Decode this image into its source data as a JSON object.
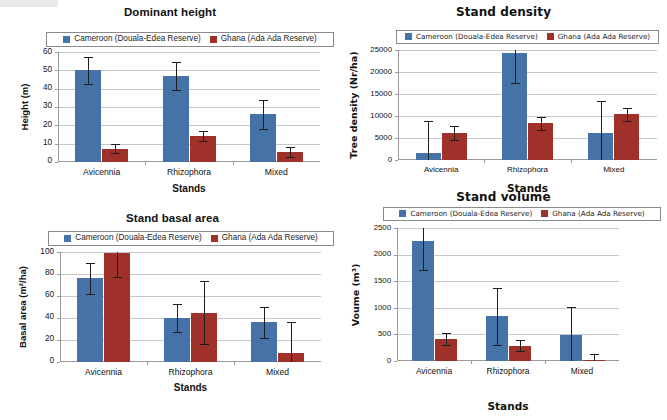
{
  "figure": {
    "legend": {
      "series": [
        {
          "name": "Cameroon (Douala-Edea Reserve)",
          "color": "#4573a7",
          "key": "cameroon"
        },
        {
          "name": "Ghana (Ada Ada Reserve)",
          "color": "#a0302a",
          "key": "ghana"
        }
      ]
    },
    "shared_categories": [
      "Avicennia",
      "Rhizophora",
      "Mixed"
    ],
    "shared_xlabel": "Stands"
  },
  "chart_data": [
    {
      "id": "dominant-height",
      "type": "bar",
      "title": "Dominant height",
      "xlabel": "Stands",
      "ylabel": "Height (m)",
      "categories": [
        "Avicennia",
        "Rhizophora",
        "Mixed"
      ],
      "yticks": [
        0,
        10,
        20,
        30,
        40,
        50,
        60
      ],
      "ylim": [
        0,
        60
      ],
      "grid": true,
      "legend_position": "top",
      "series": [
        {
          "name": "Cameroon (Douala-Edea Reserve)",
          "color": "#4573a7",
          "values": [
            50.0,
            47.0,
            26.0
          ],
          "errors": [
            7.5,
            7.5,
            8.0
          ]
        },
        {
          "name": "Ghana (Ada Ada Reserve)",
          "color": "#a0302a",
          "values": [
            7.3,
            14.3,
            5.5
          ],
          "errors": [
            2.5,
            2.7,
            2.6
          ]
        }
      ]
    },
    {
      "id": "stand-density",
      "type": "bar",
      "title": "Stand density",
      "xlabel": "Stands",
      "ylabel": "Tree density (Nr/ha)",
      "categories": [
        "Avicennia",
        "Rhizophora",
        "Mixed"
      ],
      "yticks": [
        0,
        5000,
        10000,
        15000,
        20000,
        25000
      ],
      "ylim": [
        0,
        25000
      ],
      "grid": true,
      "legend_position": "top",
      "series": [
        {
          "name": "Cameroon (Douala-Edea Reserve)",
          "color": "#4573a7",
          "values": [
            1700,
            24400,
            6200
          ],
          "errors": [
            7100,
            6800,
            7100
          ]
        },
        {
          "name": "Ghana (Ada Ada Reserve)",
          "color": "#a0302a",
          "values": [
            6100,
            8300,
            10400
          ],
          "errors": [
            1600,
            1500,
            1500
          ]
        }
      ]
    },
    {
      "id": "stand-basal-area",
      "type": "bar",
      "title": "Stand basal area",
      "xlabel": "Stands",
      "ylabel": "Basal area (m²/ha)",
      "categories": [
        "Avicennia",
        "Rhizophora",
        "Mixed"
      ],
      "yticks": [
        0,
        20,
        40,
        60,
        80,
        100
      ],
      "ylim": [
        0,
        100
      ],
      "grid": true,
      "legend_position": "top",
      "series": [
        {
          "name": "Cameroon (Douala-Edea Reserve)",
          "color": "#4573a7",
          "values": [
            76,
            40,
            36
          ],
          "errors": [
            14,
            13,
            14
          ]
        },
        {
          "name": "Ghana (Ada Ada Reserve)",
          "color": "#a0302a",
          "values": [
            99,
            45,
            8
          ],
          "errors": [
            22,
            29,
            28
          ]
        }
      ]
    },
    {
      "id": "stand-volume",
      "type": "bar",
      "title": "Stand volume",
      "xlabel": "Stands",
      "ylabel": "Voume (m³)",
      "categories": [
        "Avicennia",
        "Rhizophora",
        "Mixed"
      ],
      "yticks": [
        0,
        500,
        1000,
        1500,
        2000,
        2500
      ],
      "ylim": [
        0,
        2500
      ],
      "grid": true,
      "legend_position": "top",
      "series": [
        {
          "name": "Cameroon (Douala-Edea Reserve)",
          "color": "#4573a7",
          "values": [
            2250,
            840,
            480
          ],
          "errors": [
            540,
            540,
            540
          ]
        },
        {
          "name": "Ghana (Ada Ada Reserve)",
          "color": "#a0302a",
          "values": [
            410,
            285,
            20
          ],
          "errors": [
            115,
            105,
            120
          ]
        }
      ]
    }
  ]
}
